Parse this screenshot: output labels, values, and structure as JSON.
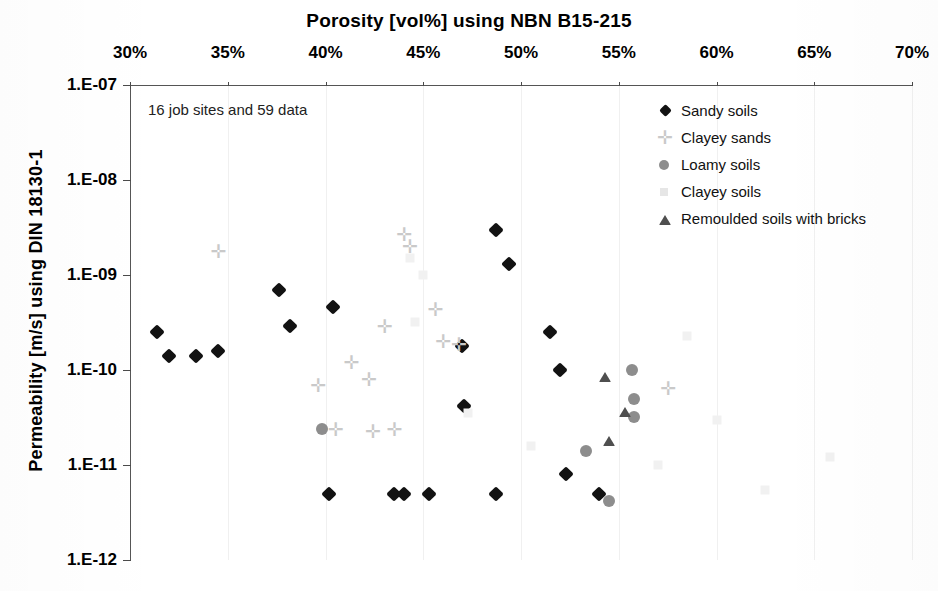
{
  "chart_data": {
    "type": "scatter",
    "title": "Porosity [vol%] using NBN B15-215",
    "xlabel": "Porosity [vol%] using NBN B15-215",
    "ylabel": "Permeability [m/s] using DIN 18130-1",
    "annotation": "16 job sites and 59 data",
    "xlim": [
      30,
      70
    ],
    "ylim": [
      1e-12,
      1e-07
    ],
    "yscale": "log",
    "xticks": [
      "30%",
      "35%",
      "40%",
      "45%",
      "50%",
      "55%",
      "60%",
      "65%",
      "70%"
    ],
    "xtick_values": [
      30,
      35,
      40,
      45,
      50,
      55,
      60,
      65,
      70
    ],
    "yticks": [
      "1.E-07",
      "1.E-08",
      "1.E-09",
      "1.E-10",
      "1.E-11",
      "1.E-12"
    ],
    "ytick_values": [
      1e-07,
      1e-08,
      1e-09,
      1e-10,
      1e-11,
      1e-12
    ],
    "grid": false,
    "legend_position": "top-right",
    "colors": {
      "sandy_soils": "#121212",
      "clayey_sands": "#c9c9c9",
      "loamy_soils": "#8d8d8d",
      "clayey_soils": "#f1f1f1",
      "remoulded_soils_with_bricks": "#4f4f4f",
      "axis": "#4a4a4a",
      "background": "#ffffff"
    },
    "series": [
      {
        "name": "Sandy soils",
        "marker": "diamond",
        "color": "#121212",
        "points": [
          [
            31.4,
            2.5e-10
          ],
          [
            32.0,
            1.4e-10
          ],
          [
            33.4,
            1.4e-10
          ],
          [
            34.5,
            1.6e-10
          ],
          [
            37.6,
            7e-10
          ],
          [
            38.2,
            2.9e-10
          ],
          [
            40.4,
            4.6e-10
          ],
          [
            40.2,
            5e-12
          ],
          [
            43.5,
            5e-12
          ],
          [
            44.0,
            5e-12
          ],
          [
            45.3,
            5e-12
          ],
          [
            47.0,
            1.8e-10
          ],
          [
            47.1,
            4.2e-11
          ],
          [
            48.7,
            5e-12
          ],
          [
            48.7,
            3e-09
          ],
          [
            49.4,
            1.3e-09
          ],
          [
            51.5,
            2.5e-10
          ],
          [
            52.0,
            1e-10
          ],
          [
            52.3,
            8e-12
          ],
          [
            54.0,
            5e-12
          ]
        ]
      },
      {
        "name": "Clayey sands",
        "marker": "cross",
        "color": "#c9c9c9",
        "points": [
          [
            34.5,
            1.8e-09
          ],
          [
            39.6,
            7e-11
          ],
          [
            41.3,
            1.2e-10
          ],
          [
            42.2,
            8e-11
          ],
          [
            43.0,
            2.9e-10
          ],
          [
            43.5,
            2.4e-11
          ],
          [
            44.0,
            2.7e-09
          ],
          [
            44.3,
            2e-09
          ],
          [
            45.6,
            4.4e-10
          ],
          [
            46.8,
            1.9e-10
          ],
          [
            40.5,
            2.4e-11
          ],
          [
            42.4,
            2.3e-11
          ],
          [
            57.5,
            6.5e-11
          ],
          [
            46.0,
            2e-10
          ]
        ]
      },
      {
        "name": "Loamy soils",
        "marker": "circle",
        "color": "#8d8d8d",
        "points": [
          [
            39.8,
            2.4e-11
          ],
          [
            55.7,
            1e-10
          ],
          [
            55.8,
            5e-11
          ],
          [
            55.8,
            3.2e-11
          ],
          [
            53.3,
            1.4e-11
          ],
          [
            54.5,
            4.2e-12
          ]
        ]
      },
      {
        "name": "Clayey soils",
        "marker": "square",
        "color": "#f1f1f1",
        "points": [
          [
            44.3,
            1.5e-09
          ],
          [
            45.0,
            1e-09
          ],
          [
            44.6,
            3.2e-10
          ],
          [
            47.3,
            3.5e-11
          ],
          [
            58.5,
            2.3e-10
          ],
          [
            60.0,
            3e-11
          ],
          [
            62.5,
            5.5e-12
          ],
          [
            65.8,
            1.2e-11
          ],
          [
            57.0,
            1e-11
          ],
          [
            50.5,
            1.6e-11
          ]
        ]
      },
      {
        "name": "Remoulded soils with bricks",
        "marker": "triangle",
        "color": "#4f4f4f",
        "points": [
          [
            54.3,
            8.5e-11
          ],
          [
            55.3,
            3.6e-11
          ],
          [
            54.5,
            1.8e-11
          ]
        ]
      }
    ]
  },
  "legend": {
    "items": [
      {
        "label": "Sandy soils",
        "marker": "diamond"
      },
      {
        "label": "Clayey sands",
        "marker": "cross"
      },
      {
        "label": "Loamy soils",
        "marker": "circle"
      },
      {
        "label": "Clayey soils",
        "marker": "square"
      },
      {
        "label": "Remoulded soils with bricks",
        "marker": "triangle"
      }
    ]
  },
  "icons": {
    "cross_glyph": "✛"
  }
}
